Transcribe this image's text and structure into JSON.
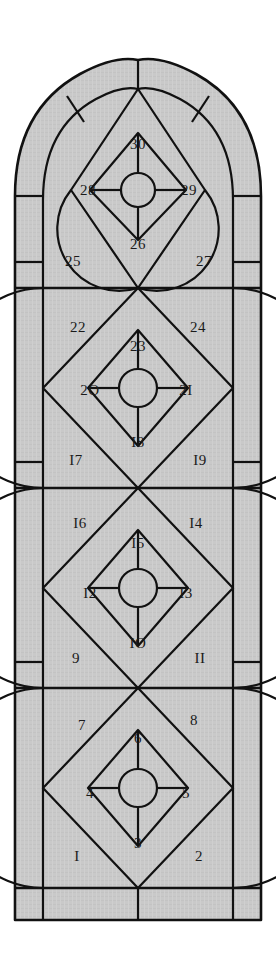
{
  "figure": {
    "colors": {
      "glass_fill": "#c9c9c9",
      "lead_line": "#111111",
      "background": "#ffffff",
      "label_text": "#1a1a1a"
    },
    "geometry": {
      "outer_left": 15,
      "outer_right": 261,
      "outer_bottom": 920,
      "apex_x": 138,
      "apex_y": 60,
      "spring_line_y": 196,
      "frame_inset": 28,
      "panel_dividers_y": [
        288,
        488,
        688,
        888
      ],
      "panel_count": 4,
      "head_bottom_y": 288
    },
    "panes": [
      {
        "id": 1,
        "label": "I",
        "x": 77,
        "y": 858,
        "panel": "lower",
        "position": "bottom-left"
      },
      {
        "id": 2,
        "label": "2",
        "x": 199,
        "y": 858,
        "panel": "lower",
        "position": "bottom-right"
      },
      {
        "id": 3,
        "label": "3",
        "x": 138,
        "y": 845,
        "panel": "lower",
        "position": "bottom-center"
      },
      {
        "id": 4,
        "label": "4",
        "x": 90,
        "y": 795,
        "panel": "lower",
        "position": "mid-left"
      },
      {
        "id": 5,
        "label": "5",
        "x": 186,
        "y": 795,
        "panel": "lower",
        "position": "mid-right"
      },
      {
        "id": 6,
        "label": "6",
        "x": 138,
        "y": 740,
        "panel": "lower",
        "position": "top-center"
      },
      {
        "id": 7,
        "label": "7",
        "x": 82,
        "y": 727,
        "panel": "lower",
        "position": "top-left"
      },
      {
        "id": 8,
        "label": "8",
        "x": 194,
        "y": 722,
        "panel": "lower",
        "position": "top-right"
      },
      {
        "id": 9,
        "label": "9",
        "x": 76,
        "y": 660,
        "panel": "lower-middle",
        "position": "bottom-left"
      },
      {
        "id": 10,
        "label": "IO",
        "x": 138,
        "y": 645,
        "panel": "lower-middle",
        "position": "bottom-center"
      },
      {
        "id": 11,
        "label": "II",
        "x": 200,
        "y": 660,
        "panel": "lower-middle",
        "position": "bottom-right"
      },
      {
        "id": 12,
        "label": "I2",
        "x": 90,
        "y": 595,
        "panel": "lower-middle",
        "position": "mid-left"
      },
      {
        "id": 13,
        "label": "I3",
        "x": 186,
        "y": 595,
        "panel": "lower-middle",
        "position": "mid-right"
      },
      {
        "id": 14,
        "label": "I4",
        "x": 196,
        "y": 525,
        "panel": "lower-middle",
        "position": "top-right"
      },
      {
        "id": 15,
        "label": "I5",
        "x": 138,
        "y": 545,
        "panel": "lower-middle",
        "position": "top-center"
      },
      {
        "id": 16,
        "label": "I6",
        "x": 80,
        "y": 525,
        "panel": "lower-middle",
        "position": "top-left"
      },
      {
        "id": 17,
        "label": "I7",
        "x": 76,
        "y": 462,
        "panel": "upper-middle",
        "position": "bottom-left"
      },
      {
        "id": 18,
        "label": "I8",
        "x": 138,
        "y": 444,
        "panel": "upper-middle",
        "position": "bottom-center"
      },
      {
        "id": 19,
        "label": "I9",
        "x": 200,
        "y": 462,
        "panel": "upper-middle",
        "position": "bottom-right"
      },
      {
        "id": 20,
        "label": "2O",
        "x": 90,
        "y": 392,
        "panel": "upper-middle",
        "position": "mid-left"
      },
      {
        "id": 21,
        "label": "2I",
        "x": 186,
        "y": 392,
        "panel": "upper-middle",
        "position": "mid-right"
      },
      {
        "id": 22,
        "label": "22",
        "x": 78,
        "y": 329,
        "panel": "upper-middle",
        "position": "top-left"
      },
      {
        "id": 23,
        "label": "23",
        "x": 138,
        "y": 348,
        "panel": "upper-middle",
        "position": "top-center"
      },
      {
        "id": 24,
        "label": "24",
        "x": 198,
        "y": 329,
        "panel": "upper-middle",
        "position": "top-right"
      },
      {
        "id": 25,
        "label": "25",
        "x": 73,
        "y": 263,
        "panel": "head",
        "position": "bottom-left"
      },
      {
        "id": 26,
        "label": "26",
        "x": 138,
        "y": 246,
        "panel": "head",
        "position": "bottom-center"
      },
      {
        "id": 27,
        "label": "27",
        "x": 204,
        "y": 263,
        "panel": "head",
        "position": "bottom-right"
      },
      {
        "id": 28,
        "label": "28",
        "x": 88,
        "y": 192,
        "panel": "head",
        "position": "mid-left"
      },
      {
        "id": 29,
        "label": "29",
        "x": 189,
        "y": 192,
        "panel": "head",
        "position": "mid-right"
      },
      {
        "id": 30,
        "label": "30",
        "x": 138,
        "y": 146,
        "panel": "head",
        "position": "top-center"
      }
    ]
  }
}
